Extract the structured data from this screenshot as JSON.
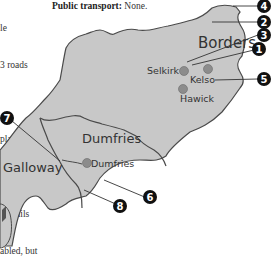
{
  "page": {
    "left_text_lines": [
      "le",
      "3 roads",
      "",
      "plains of",
      "ogs.",
      "of trails",
      "abled, but"
    ],
    "transport_label": "Public transport:",
    "transport_value": " None."
  },
  "map": {
    "colors": {
      "land": "#c8c8c8",
      "border": "#4a4a4a",
      "town_dot": "#8c8c8c",
      "marker_bg": "#111111",
      "callout_line": "#333333"
    },
    "regions": [
      {
        "name": "Borders"
      },
      {
        "name": "Dumfries"
      },
      {
        "name": "Galloway"
      }
    ],
    "towns": [
      {
        "name": "Selkirk"
      },
      {
        "name": "Kelso"
      },
      {
        "name": "Hawick"
      },
      {
        "name": "Dumfries"
      }
    ],
    "markers": [
      {
        "number": "4"
      },
      {
        "number": "2"
      },
      {
        "number": "3"
      },
      {
        "number": "1"
      },
      {
        "number": "5"
      },
      {
        "number": "7"
      },
      {
        "number": "6"
      },
      {
        "number": "8"
      }
    ]
  }
}
